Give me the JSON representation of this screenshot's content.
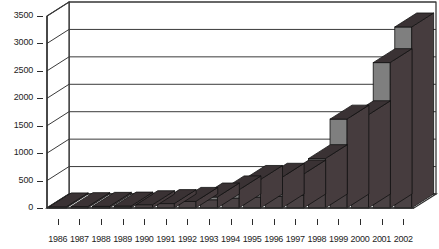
{
  "chart_data": {
    "type": "bar",
    "title": "",
    "subtitle": "",
    "xlabel": "",
    "ylabel": "",
    "grid": true,
    "legend": false,
    "legend_position": "none",
    "style": "3d-stacked-column",
    "ylim": [
      0,
      3500
    ],
    "ytick_step": 500,
    "ytick_labels": [
      "0",
      "500",
      "1000",
      "1500",
      "2000",
      "2500",
      "3000",
      "3500"
    ],
    "ytick_values": [
      0,
      500,
      1000,
      1500,
      2000,
      2500,
      3000,
      3500
    ],
    "categories": [
      "1986",
      "1987",
      "1988",
      "1989",
      "1990",
      "1991",
      "1992",
      "1993",
      "1994",
      "1995",
      "1996",
      "1997",
      "1998",
      "1999",
      "2000",
      "2001",
      "2002"
    ],
    "values": [
      20,
      25,
      30,
      35,
      60,
      80,
      120,
      200,
      330,
      520,
      560,
      620,
      900,
      1620,
      1700,
      2650,
      3300
    ],
    "series": [
      {
        "name": "lower-segment",
        "values": [
          20,
          25,
          30,
          35,
          60,
          80,
          120,
          150,
          180,
          200,
          210,
          230,
          330,
          520,
          540,
          720,
          830
        ]
      },
      {
        "name": "upper-segment",
        "values": [
          0,
          0,
          0,
          0,
          0,
          0,
          0,
          50,
          150,
          320,
          350,
          390,
          570,
          1100,
          1160,
          1930,
          2470
        ]
      }
    ],
    "colors": {
      "front_upper": "#7f7f7f",
      "front_lower": "#4a4244",
      "side": "#463c3e",
      "top": "#3a3234",
      "gridline": "#3a3a3a",
      "axis": "#2b2b2b",
      "background": "#ffffff",
      "text": "#1d1d1d"
    }
  }
}
